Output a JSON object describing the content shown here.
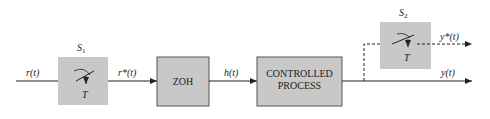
{
  "diagram": {
    "colors": {
      "block_fill": "#c8c8c8",
      "block_stroke": "#555555",
      "line": "#222222"
    },
    "signals": {
      "input": "r(t)",
      "sampled_input": "r*(t)",
      "zoh_output": "h(t)",
      "sampled_output": "y*(t)",
      "output": "y(t)"
    },
    "samplers": [
      {
        "name": "S",
        "sub": "1",
        "period": "T"
      },
      {
        "name": "S",
        "sub": "2",
        "period": "T"
      }
    ],
    "blocks": [
      {
        "label_lines": [
          "ZOH"
        ]
      },
      {
        "label_lines": [
          "CONTROLLED",
          "PROCESS"
        ]
      }
    ]
  }
}
